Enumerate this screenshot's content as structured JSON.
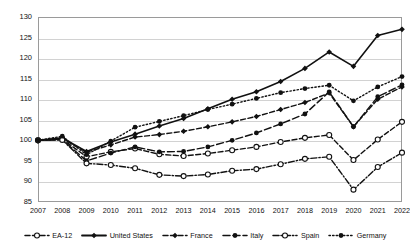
{
  "chart_data": {
    "type": "line",
    "title": "",
    "subtitle": "",
    "xlabel": "",
    "ylabel": "",
    "grid": true,
    "legend_position": "bottom",
    "index_base": "2007 = 100",
    "categories": [
      "2007",
      "2008",
      "2009",
      "2010",
      "2011",
      "2012",
      "2013",
      "2014",
      "2015",
      "2016",
      "2017",
      "2018",
      "2019",
      "2020",
      "2021",
      "2022"
    ],
    "x": [
      2007,
      2008,
      2009,
      2010,
      2011,
      2012,
      2013,
      2014,
      2015,
      2016,
      2017,
      2018,
      2019,
      2020,
      2021,
      2022
    ],
    "ylim": [
      85,
      130
    ],
    "yticks": [
      85,
      90,
      95,
      100,
      105,
      110,
      115,
      120,
      125,
      130
    ],
    "xlim": [
      2007,
      2022
    ],
    "series": [
      {
        "name": "EA-12",
        "marker": "open-circle",
        "dash": "dashed",
        "color": "#111111",
        "values": [
          100.0,
          100.3,
          96.0,
          97.2,
          98.0,
          96.6,
          96.2,
          96.8,
          97.6,
          98.4,
          99.6,
          100.6,
          101.3,
          95.2,
          100.2,
          104.5
        ]
      },
      {
        "name": "United States",
        "marker": "filled-diamond",
        "dash": "solid",
        "color": "#111111",
        "values": [
          100.0,
          100.6,
          97.3,
          99.6,
          101.5,
          103.5,
          105.3,
          107.7,
          110.0,
          111.8,
          114.3,
          117.5,
          121.5,
          118.0,
          125.5,
          127.0
        ]
      },
      {
        "name": "France",
        "marker": "filled-diamond",
        "dash": "dashed",
        "color": "#111111",
        "values": [
          100.0,
          100.4,
          97.1,
          98.9,
          100.8,
          101.4,
          102.2,
          103.3,
          104.5,
          105.8,
          107.5,
          109.2,
          111.5,
          103.3,
          110.0,
          113.0
        ]
      },
      {
        "name": "Italy",
        "marker": "filled-circle",
        "dash": "long-dash",
        "color": "#111111",
        "values": [
          100.0,
          100.2,
          95.0,
          96.9,
          98.4,
          97.2,
          97.3,
          98.4,
          100.0,
          101.8,
          104.0,
          106.4,
          111.8,
          103.3,
          110.6,
          113.5
        ]
      },
      {
        "name": "Spain",
        "marker": "open-circle",
        "dash": "dash-dot",
        "color": "#111111",
        "values": [
          100.0,
          100.1,
          94.4,
          94.0,
          93.2,
          91.6,
          91.3,
          91.7,
          92.6,
          93.0,
          94.2,
          95.5,
          96.0,
          88.0,
          93.5,
          97.0
        ]
      },
      {
        "name": "Germany",
        "marker": "filled-circle",
        "dash": "dotted",
        "color": "#111111",
        "values": [
          100.0,
          101.0,
          96.5,
          99.8,
          103.2,
          104.6,
          106.0,
          107.5,
          108.8,
          110.2,
          111.6,
          112.6,
          113.4,
          109.6,
          113.0,
          115.5
        ]
      }
    ]
  }
}
